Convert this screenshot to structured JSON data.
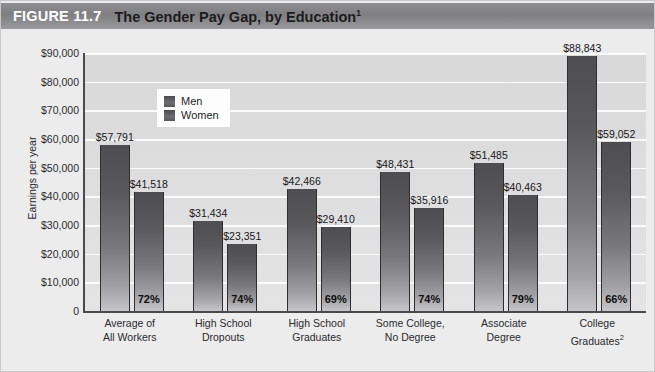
{
  "figure": {
    "number_label": "FIGURE 11.7",
    "title": "The Gender Pay Gap, by Education",
    "title_footnote": "1"
  },
  "chart_data": {
    "type": "bar",
    "title": "The Gender Pay Gap, by Education",
    "xlabel": "",
    "ylabel": "Earnings per year",
    "ylim": [
      0,
      90000
    ],
    "ytick_labels": [
      "0",
      "$10,000",
      "$20,000",
      "$30,000",
      "$40,000",
      "$50,000",
      "$60,000",
      "$70,000",
      "$80,000",
      "$90,000"
    ],
    "ytick_values": [
      0,
      10000,
      20000,
      30000,
      40000,
      50000,
      60000,
      70000,
      80000,
      90000
    ],
    "grid": true,
    "legend_position": "upper-left-inside",
    "categories": [
      "Average of\nAll Workers",
      "High School\nDropouts",
      "High School\nGraduates",
      "Some College,\nNo Degree",
      "Associate\nDegree",
      "College\nGraduates"
    ],
    "category_lines": [
      [
        "Average of",
        "All Workers"
      ],
      [
        "High School",
        "Dropouts"
      ],
      [
        "High School",
        "Graduates"
      ],
      [
        "Some College,",
        "No Degree"
      ],
      [
        "Associate",
        "Degree"
      ],
      [
        "College",
        "Graduates"
      ]
    ],
    "category_footnotes": [
      "",
      "",
      "",
      "",
      "",
      "2"
    ],
    "series": [
      {
        "name": "Men",
        "values": [
          57791,
          31434,
          42466,
          48431,
          51485,
          88843
        ],
        "value_labels": [
          "$57,791",
          "$31,434",
          "$42,466",
          "$48,431",
          "$51,485",
          "$88,843"
        ]
      },
      {
        "name": "Women",
        "values": [
          41518,
          23351,
          29410,
          35916,
          40463,
          59052
        ],
        "value_labels": [
          "$41,518",
          "$23,351",
          "$29,410",
          "$35,916",
          "$40,463",
          "$59,052"
        ]
      }
    ],
    "ratio_labels": [
      "72%",
      "74%",
      "69%",
      "74%",
      "79%",
      "66%"
    ],
    "annotations_note": "Percentages show women's earnings as a share of men's earnings within each education level."
  },
  "colors": {
    "title_band": "#858587",
    "plot_background": "#dedee0",
    "gridline": "#fbfbfb",
    "bar_top": "#4e4e50",
    "bar_bottom": "#c6c6c8",
    "axis": "#4a4a4b",
    "page_background": "#ececed"
  }
}
